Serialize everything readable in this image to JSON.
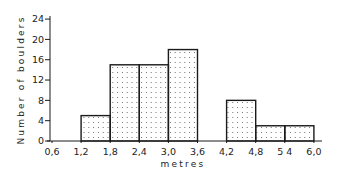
{
  "chart_data": {
    "type": "bar",
    "subtype": "histogram",
    "title": "",
    "xlabel": "metres",
    "ylabel": "Number of boulders",
    "x_tick_labels": [
      "0,6",
      "1,2",
      "1,8",
      "2,4",
      "3,0",
      "3,6",
      "4,2",
      "4,8",
      "5 4",
      "6,0"
    ],
    "x_ticks": [
      0.6,
      1.2,
      1.8,
      2.4,
      3.0,
      3.6,
      4.2,
      4.8,
      5.4,
      6.0
    ],
    "y_ticks": [
      0,
      4,
      8,
      12,
      16,
      20,
      24
    ],
    "y_tick_labels": [
      "0",
      "4",
      "8",
      "12",
      "16",
      "20",
      "24"
    ],
    "xlim": [
      0.6,
      6.0
    ],
    "ylim": [
      0,
      24
    ],
    "grid": false,
    "legend": null,
    "fill_pattern": "dotted",
    "bins": [
      {
        "from": 1.2,
        "to": 1.8,
        "value": 5
      },
      {
        "from": 1.8,
        "to": 2.4,
        "value": 15
      },
      {
        "from": 2.4,
        "to": 3.0,
        "value": 15
      },
      {
        "from": 3.0,
        "to": 3.6,
        "value": 18
      },
      {
        "from": 3.6,
        "to": 4.2,
        "value": 0
      },
      {
        "from": 4.2,
        "to": 4.8,
        "value": 8
      },
      {
        "from": 4.8,
        "to": 5.4,
        "value": 3
      },
      {
        "from": 5.4,
        "to": 6.0,
        "value": 3
      }
    ],
    "categories": [
      "1.2–1.8",
      "1.8–2.4",
      "2.4–3.0",
      "3.0–3.6",
      "3.6–4.2",
      "4.2–4.8",
      "4.8–5.4",
      "5.4–6.0"
    ],
    "values": [
      5,
      15,
      15,
      18,
      0,
      8,
      3,
      3
    ]
  },
  "colors": {
    "ink": "#1a1a1a",
    "background": "#ffffff",
    "dot": "#555555"
  }
}
